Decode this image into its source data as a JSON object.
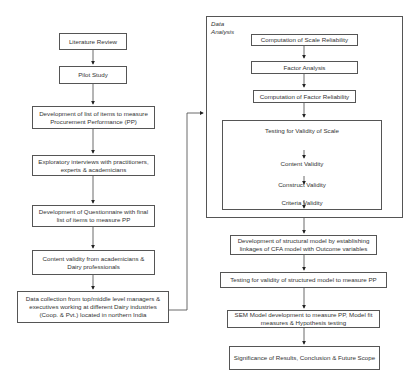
{
  "left_column": [
    {
      "id": "lit",
      "text": "Literature Review"
    },
    {
      "id": "pilot",
      "text": "Pilot Study"
    },
    {
      "id": "dev_list",
      "text": "Development of list of items to measure Procurement Performance (PP)"
    },
    {
      "id": "interviews",
      "text": "Exploratory interviews with practitioners, experts & academicians"
    },
    {
      "id": "questionnaire",
      "text": "Development of Questionnaire with final list of items to measure PP"
    },
    {
      "id": "content_validity",
      "text": "Content validity from academicians & Dairy professionals"
    },
    {
      "id": "data_collection",
      "text": "Data collection from top/middle level managers & executives working at different Dairy industries (Coop. & Pvt.) located in northern India"
    }
  ],
  "data_analysis": {
    "label": "Data Analysis",
    "steps": [
      {
        "id": "scale_rel",
        "text": "Computation of Scale Reliability"
      },
      {
        "id": "factor",
        "text": "Factor Analysis"
      },
      {
        "id": "factor_rel",
        "text": "Computation of Factor Reliability"
      }
    ],
    "validity": {
      "title": "Testing for Validity of Scale",
      "items": [
        "Content Validity",
        "Construct Validity",
        "Criteria Validity"
      ]
    }
  },
  "right_column": [
    {
      "id": "structural",
      "text": "Development of structural model by establishing linkages of CFA model with Outcome variables"
    },
    {
      "id": "testing_struct",
      "text": "Testing for validity of structured model to measure PP"
    },
    {
      "id": "sem",
      "text": "SEM Model development to measure PP, Model fit measures & Hypothesis testing"
    },
    {
      "id": "significance",
      "text": "Significance of Results, Conclusion & Future Scope"
    }
  ]
}
